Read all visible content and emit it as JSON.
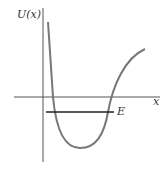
{
  "diagram": {
    "y_label": "U(x)",
    "x_label": "x",
    "energy_label": "E",
    "colors": {
      "curve": "#777777",
      "axes": "#555555",
      "energy": "#222222"
    }
  }
}
